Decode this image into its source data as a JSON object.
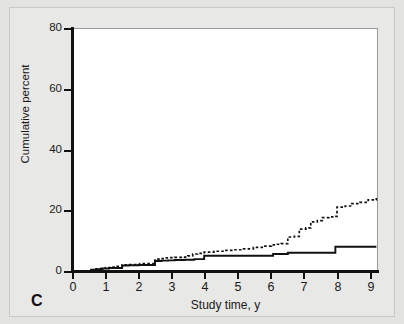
{
  "panel": {
    "label": "C"
  },
  "chart_data": {
    "type": "line",
    "subtype": "step-cumulative-incidence",
    "title": "",
    "xlabel": "Study time, y",
    "ylabel": "Cumulative percent",
    "xlim": [
      0,
      9.3
    ],
    "ylim": [
      0,
      80
    ],
    "xticks": [
      0,
      1,
      2,
      3,
      4,
      5,
      6,
      7,
      8,
      9
    ],
    "xticklabels": [
      "0",
      "1",
      "2",
      "3",
      "4",
      "5",
      "6",
      "7",
      "8",
      "9"
    ],
    "yticks": [
      0,
      20,
      40,
      60,
      80
    ],
    "yticklabels": [
      "0",
      "20",
      "40",
      "60",
      "80"
    ],
    "grid": false,
    "legend": "none",
    "step_mode": "post",
    "series": [
      {
        "name": "dashed-curve",
        "style": "dashed",
        "color": "#111111",
        "final_value": 24,
        "x": [
          0,
          0.55,
          0.7,
          0.85,
          1.0,
          1.15,
          1.3,
          1.5,
          1.65,
          1.95,
          2.05,
          2.5,
          2.65,
          2.8,
          2.95,
          3.1,
          3.3,
          3.5,
          3.65,
          3.8,
          4.0,
          4.3,
          4.6,
          4.9,
          5.2,
          5.5,
          5.8,
          6.05,
          6.2,
          6.35,
          6.55,
          6.75,
          6.9,
          7.1,
          7.25,
          7.45,
          7.6,
          7.8,
          7.95,
          8.05,
          8.3,
          8.5,
          8.75,
          9.0,
          9.25
        ],
        "y": [
          0,
          0.4,
          0.7,
          0.9,
          1.1,
          1.3,
          1.5,
          2.0,
          2.1,
          2.2,
          2.4,
          3.9,
          4.1,
          4.3,
          4.4,
          4.5,
          4.6,
          5.0,
          5.6,
          5.8,
          6.2,
          6.5,
          6.8,
          7.0,
          7.3,
          7.8,
          8.2,
          8.6,
          8.8,
          9.0,
          11.2,
          11.4,
          13.8,
          14.2,
          16.2,
          16.6,
          17.6,
          17.8,
          18.0,
          21.0,
          21.4,
          22.2,
          22.6,
          23.4,
          24.0
        ]
      },
      {
        "name": "solid-curve",
        "style": "solid",
        "color": "#111111",
        "final_value": 8,
        "x": [
          0,
          0.55,
          0.7,
          0.9,
          1.1,
          1.5,
          1.7,
          2.0,
          2.5,
          2.7,
          2.9,
          3.1,
          3.4,
          3.7,
          4.0,
          4.5,
          5.0,
          5.5,
          6.0,
          6.1,
          6.55,
          7.0,
          7.5,
          8.0,
          8.5,
          9.0,
          9.25
        ],
        "y": [
          0,
          0.4,
          0.6,
          0.8,
          1.0,
          1.8,
          1.9,
          2.0,
          3.3,
          3.4,
          3.5,
          3.6,
          3.7,
          3.9,
          5.0,
          5.0,
          5.0,
          5.0,
          5.0,
          5.6,
          6.0,
          6.0,
          6.0,
          8.0,
          8.0,
          8.0,
          8.0
        ]
      }
    ]
  },
  "colors": {
    "page_background": "#e3e3e1",
    "plot_background": "#ffffff",
    "axis": "#111111",
    "frame": "#9a9a98"
  }
}
